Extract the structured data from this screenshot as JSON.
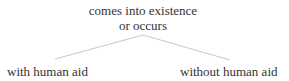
{
  "tree": {
    "root": {
      "line1": "comes into existence",
      "line2": "or occurs"
    },
    "children": [
      {
        "label": "with human aid"
      },
      {
        "label": "without human aid"
      }
    ],
    "edge_color": "#c8c8c8",
    "text_color": "#333333"
  }
}
